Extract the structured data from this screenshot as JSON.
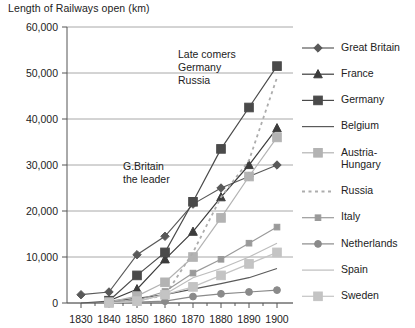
{
  "chart_data": {
    "type": "line",
    "title": "Length of Railways open (km)",
    "xlabel": "",
    "ylabel": "",
    "x": [
      1830,
      1840,
      1850,
      1860,
      1870,
      1880,
      1890,
      1900
    ],
    "xticklabels": [
      "1830",
      "1840",
      "1850",
      "1860",
      "1870",
      "1880",
      "1890",
      "1900"
    ],
    "yticks": [
      0,
      10000,
      20000,
      30000,
      40000,
      50000,
      60000
    ],
    "yticklabels": [
      "0",
      "10,000",
      "20,000",
      "30,000",
      "40,000",
      "50,000",
      "60,000"
    ],
    "ylim": [
      0,
      60000
    ],
    "xlim": [
      1825,
      1905
    ],
    "grid": "horizontal",
    "legend_position": "right",
    "series": [
      {
        "name": "Great Britain",
        "marker": "diamond",
        "linestyle": "solid",
        "color": "#595959",
        "x": [
          1830,
          1840,
          1850,
          1860,
          1870,
          1880,
          1890,
          1900
        ],
        "values": [
          1800,
          2400,
          10500,
          14500,
          21500,
          25000,
          27500,
          30000
        ]
      },
      {
        "name": "France",
        "marker": "triangle",
        "linestyle": "solid",
        "color": "#3c3c3c",
        "x": [
          1840,
          1850,
          1860,
          1870,
          1880,
          1890,
          1900
        ],
        "values": [
          500,
          3000,
          9500,
          15500,
          23000,
          30000,
          38000
        ]
      },
      {
        "name": "Germany",
        "marker": "square",
        "linestyle": "solid",
        "color": "#4a4a4a",
        "x": [
          1840,
          1850,
          1860,
          1870,
          1880,
          1890,
          1900
        ],
        "values": [
          500,
          6000,
          11000,
          22000,
          33500,
          42500,
          51500
        ]
      },
      {
        "name": "Belgium",
        "marker": "none",
        "linestyle": "solid",
        "color": "#5a5a5a",
        "x": [
          1830,
          1840,
          1850,
          1860,
          1870,
          1880,
          1890,
          1900
        ],
        "values": [
          0,
          400,
          1000,
          1800,
          3000,
          4200,
          5500,
          7500
        ]
      },
      {
        "name": "Austria-Hungary",
        "marker": "square-light",
        "linestyle": "solid",
        "color": "#b3b3b3",
        "x": [
          1840,
          1850,
          1860,
          1870,
          1880,
          1890,
          1900
        ],
        "values": [
          200,
          1500,
          4500,
          10000,
          18500,
          27500,
          36000
        ]
      },
      {
        "name": "Russia",
        "marker": "none",
        "linestyle": "dashed",
        "color": "#adadad",
        "x": [
          1840,
          1850,
          1860,
          1870,
          1880,
          1890,
          1900
        ],
        "values": [
          300,
          600,
          1600,
          11000,
          23000,
          31000,
          49000
        ]
      },
      {
        "name": "Italy",
        "marker": "small-square",
        "linestyle": "solid",
        "color": "#9a9a9a",
        "x": [
          1840,
          1850,
          1860,
          1870,
          1880,
          1890,
          1900
        ],
        "values": [
          200,
          600,
          2500,
          6500,
          9500,
          13000,
          16500
        ]
      },
      {
        "name": "Netherlands",
        "marker": "circle",
        "linestyle": "solid",
        "color": "#8a8a8a",
        "x": [
          1840,
          1850,
          1860,
          1870,
          1880,
          1890,
          1900
        ],
        "values": [
          100,
          200,
          400,
          1400,
          2000,
          2400,
          2800
        ]
      },
      {
        "name": "Spain",
        "marker": "none",
        "linestyle": "solid",
        "color": "#bdbdbd",
        "x": [
          1840,
          1850,
          1860,
          1870,
          1880,
          1890,
          1900
        ],
        "values": [
          0,
          300,
          1900,
          5500,
          7500,
          10000,
          13000
        ]
      },
      {
        "name": "Sweden",
        "marker": "square-light",
        "linestyle": "solid",
        "color": "#c4c4c4",
        "x": [
          1840,
          1850,
          1860,
          1870,
          1880,
          1890,
          1900
        ],
        "values": [
          0,
          400,
          1800,
          3500,
          6000,
          8500,
          11000
        ]
      }
    ],
    "annotations": [
      {
        "id": "late-comers",
        "lines": [
          "Late comers",
          "Germany",
          "Russia"
        ],
        "x": 178,
        "y": 58
      },
      {
        "id": "gb-leader",
        "lines": [
          "G.Britain",
          "the leader"
        ],
        "x": 123,
        "y": 170
      }
    ]
  },
  "legend": {
    "items": [
      {
        "label": "Great Britain",
        "marker": "diamond",
        "linestyle": "solid",
        "color": "#595959"
      },
      {
        "label": "France",
        "marker": "triangle",
        "linestyle": "solid",
        "color": "#3c3c3c"
      },
      {
        "label": "Germany",
        "marker": "square",
        "linestyle": "solid",
        "color": "#4a4a4a"
      },
      {
        "label": "Belgium",
        "marker": "none",
        "linestyle": "solid",
        "color": "#5a5a5a"
      },
      {
        "label": "Austria-",
        "label2": "Hungary",
        "marker": "square-light",
        "linestyle": "solid",
        "color": "#b3b3b3"
      },
      {
        "label": "Russia",
        "marker": "none",
        "linestyle": "dashed",
        "color": "#adadad"
      },
      {
        "label": "Italy",
        "marker": "small-square",
        "linestyle": "solid",
        "color": "#9a9a9a"
      },
      {
        "label": "Netherlands",
        "marker": "circle",
        "linestyle": "solid",
        "color": "#8a8a8a"
      },
      {
        "label": "Spain",
        "marker": "none",
        "linestyle": "solid",
        "color": "#bdbdbd"
      },
      {
        "label": "Sweden",
        "marker": "square-light",
        "linestyle": "solid",
        "color": "#c4c4c4"
      }
    ]
  }
}
